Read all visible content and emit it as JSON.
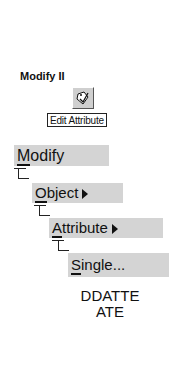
{
  "toolbar": {
    "title": "Modify II",
    "button": {
      "icon": "edit-attribute-icon",
      "tooltip": "Edit Attribute"
    }
  },
  "menu_path": [
    {
      "label": "Modify",
      "mnemonic": "M",
      "rest": "odify",
      "submenu": false
    },
    {
      "label": "Object",
      "mnemonic": "O",
      "rest": "bject",
      "submenu": true
    },
    {
      "label": "Attribute",
      "mnemonic": "A",
      "rest": "ttribute",
      "submenu": true
    },
    {
      "label": "Single...",
      "mnemonic": "S",
      "rest": "ingle...",
      "submenu": false
    }
  ],
  "command": {
    "line1": "DDATTE",
    "line2": "ATE"
  }
}
